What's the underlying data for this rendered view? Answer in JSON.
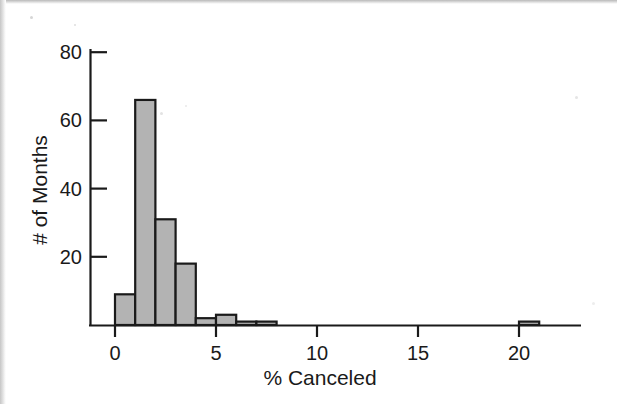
{
  "figure": {
    "background_color": "#ffffff",
    "ink_color": "#1a1a1a",
    "bar_fill_color": "#b3b3b3",
    "bar_edge_color": "#1a1a1a"
  },
  "chart_data": {
    "type": "bar",
    "title": "",
    "subtitle": "",
    "xlabel": "% Canceled",
    "ylabel": "# of Months",
    "xlim": [
      -0.8,
      23.2
    ],
    "ylim": [
      0,
      84
    ],
    "xticks": [
      0,
      5,
      10,
      15,
      20
    ],
    "xtick_labels": [
      "0",
      "5",
      "10",
      "15",
      "20"
    ],
    "yticks": [
      20,
      40,
      60,
      80
    ],
    "ytick_labels": [
      "20",
      "40",
      "60",
      "80"
    ],
    "grid": false,
    "legend": null,
    "bin_width": 1,
    "bin_starts": [
      0,
      1,
      2,
      3,
      4,
      5,
      6,
      7,
      20
    ],
    "categories": [
      "0-1",
      "1-2",
      "2-3",
      "3-4",
      "4-5",
      "5-6",
      "6-7",
      "7-8",
      "20-21"
    ],
    "values": [
      9,
      66,
      31,
      18,
      2,
      3,
      1,
      1,
      1
    ],
    "annotations": []
  },
  "axis": {
    "x_tick_label_0": "0",
    "x_tick_label_1": "5",
    "x_tick_label_2": "10",
    "x_tick_label_3": "15",
    "x_tick_label_4": "20",
    "y_tick_label_0": "20",
    "y_tick_label_1": "40",
    "y_tick_label_2": "60",
    "y_tick_label_3": "80",
    "x_axis_title": "% Canceled",
    "y_axis_title": "# of Months"
  }
}
